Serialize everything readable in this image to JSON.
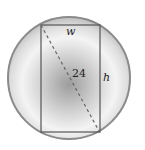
{
  "diagram": {
    "labels": {
      "width": "w",
      "height": "h",
      "diagonal": "24"
    },
    "colors": {
      "circle_edge": "#8a8a8a",
      "circle_fill_light": "#f2f2f2",
      "circle_fill_dark": "#9a9a9a",
      "rectangle_stroke": "#555555",
      "diagonal": "#666666"
    }
  }
}
